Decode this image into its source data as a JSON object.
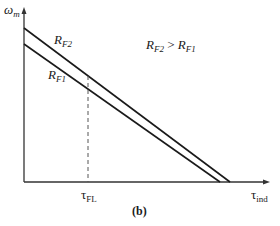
{
  "figure": {
    "caption": "(b)",
    "y_axis": {
      "symbol": "ω",
      "subscript": "m"
    },
    "x_axis": {
      "symbol": "τ",
      "subscript": "ind"
    },
    "tick_label": {
      "symbol": "τ",
      "subscript": "FL"
    },
    "annotation": {
      "left_sym": "R",
      "left_sub": "F2",
      "op": " > ",
      "right_sym": "R",
      "right_sub": "F1"
    },
    "curves": [
      {
        "sym": "R",
        "sub": "F2",
        "y_intercept_px": 28,
        "x_intercept_px": 230
      },
      {
        "sym": "R",
        "sub": "F1",
        "y_intercept_px": 44,
        "x_intercept_px": 220
      }
    ],
    "colors": {
      "line": "#1a1a1a",
      "axis": "#333333",
      "dashed": "#555555"
    }
  }
}
